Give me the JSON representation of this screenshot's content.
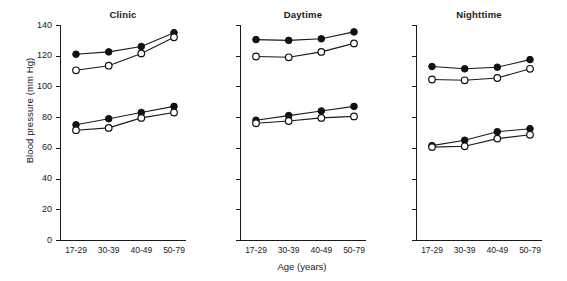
{
  "figure": {
    "ylabel": "Blood pressure (mm Hg)",
    "xlabel": "Age (years)",
    "axis_color": "#1a1a1a",
    "background": "#ffffff"
  },
  "chart_data": {
    "type": "line",
    "title": "",
    "xlabel": "Age (years)",
    "ylabel": "Blood pressure (mm Hg)",
    "categories": [
      "17-29",
      "30-39",
      "40-49",
      "50-79"
    ],
    "ylim": [
      0,
      140
    ],
    "ytick_labels": [
      "0",
      "20",
      "40",
      "60",
      "80",
      "100",
      "120",
      "140"
    ],
    "yticks": [
      0,
      20,
      40,
      60,
      80,
      100,
      120,
      140
    ],
    "grid": false,
    "legend_position": "none",
    "marker_types": {
      "filled": "filled-circle",
      "open": "open-circle"
    },
    "panels": [
      {
        "title": "Clinic",
        "series": [
          {
            "name": "Systolic filled",
            "marker": "filled",
            "values": [
              121,
              122.5,
              126,
              135
            ]
          },
          {
            "name": "Systolic open",
            "marker": "open",
            "values": [
              110.5,
              113.5,
              121.5,
              132
            ]
          },
          {
            "name": "Diastolic filled",
            "marker": "filled",
            "values": [
              75,
              79,
              83,
              87
            ]
          },
          {
            "name": "Diastolic open",
            "marker": "open",
            "values": [
              71.5,
              73,
              79.5,
              83
            ]
          }
        ]
      },
      {
        "title": "Daytime",
        "series": [
          {
            "name": "Systolic filled",
            "marker": "filled",
            "values": [
              130.5,
              130,
              131,
              135.5
            ]
          },
          {
            "name": "Systolic open",
            "marker": "open",
            "values": [
              119.5,
              119,
              122.5,
              128
            ]
          },
          {
            "name": "Diastolic filled",
            "marker": "filled",
            "values": [
              78,
              81,
              84,
              87
            ]
          },
          {
            "name": "Diastolic open",
            "marker": "open",
            "values": [
              76,
              77.5,
              79.5,
              80.5
            ]
          }
        ]
      },
      {
        "title": "Nighttime",
        "series": [
          {
            "name": "Systolic filled",
            "marker": "filled",
            "values": [
              113,
              111.5,
              112.5,
              117.5
            ]
          },
          {
            "name": "Systolic open",
            "marker": "open",
            "values": [
              104.5,
              104,
              105.5,
              111.5
            ]
          },
          {
            "name": "Diastolic filled",
            "marker": "filled",
            "values": [
              61.5,
              65,
              70.5,
              72.5
            ]
          },
          {
            "name": "Diastolic open",
            "marker": "open",
            "values": [
              60.5,
              61,
              66,
              68.5
            ]
          }
        ]
      }
    ]
  }
}
